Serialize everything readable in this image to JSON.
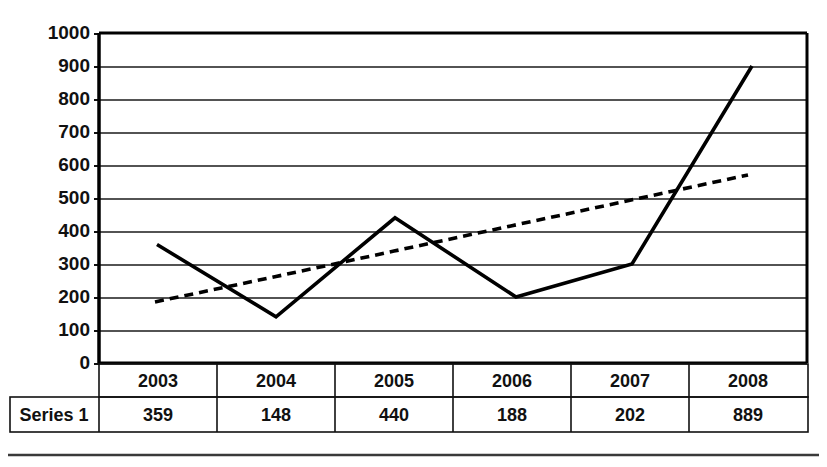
{
  "chart_data": {
    "type": "line",
    "title": "",
    "xlabel": "",
    "ylabel": "",
    "categories": [
      "2003",
      "2004",
      "2005",
      "2006",
      "2007",
      "2008"
    ],
    "ylim": [
      0,
      1000
    ],
    "y_ticks": [
      0,
      100,
      200,
      300,
      400,
      500,
      600,
      700,
      800,
      900,
      1000
    ],
    "y_tick_labels": [
      "0",
      "100",
      "200",
      "300",
      "400",
      "500",
      "600",
      "700",
      "800",
      "900",
      "1000"
    ],
    "grid": true,
    "legend": "none",
    "series": [
      {
        "name": "Series 1",
        "style": "solid",
        "color": "#000000",
        "values": [
          359,
          148,
          440,
          188,
          202,
          889
        ],
        "plotted_values": [
          359,
          140,
          440,
          200,
          300,
          900
        ]
      },
      {
        "name": "Trendline",
        "style": "dashed",
        "color": "#000000",
        "values": [
          185,
          262,
          339,
          416,
          493,
          570
        ]
      }
    ]
  },
  "data_table": {
    "row_label": "Series 1",
    "headers": [
      "2003",
      "2004",
      "2005",
      "2006",
      "2007",
      "2008"
    ],
    "values": [
      "359",
      "148",
      "440",
      "188",
      "202",
      "889"
    ]
  },
  "axis": {
    "tick_0": "0",
    "tick_100": "100",
    "tick_200": "200",
    "tick_300": "300",
    "tick_400": "400",
    "tick_500": "500",
    "tick_600": "600",
    "tick_700": "700",
    "tick_800": "800",
    "tick_900": "900",
    "tick_1000": "1000"
  }
}
